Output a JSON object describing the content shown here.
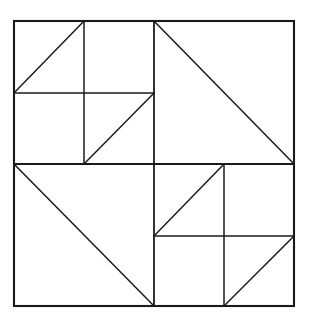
{
  "figure": {
    "background_color": "#ffffff",
    "line_color": "#1a1a1a",
    "canvas": {
      "width": 311,
      "height": 326
    },
    "bounds": {
      "left": 14,
      "top": 21,
      "right": 294,
      "bottom": 306
    },
    "center": {
      "x": 154,
      "y": 164
    }
  },
  "chart_data": {
    "type": "diagram",
    "xlim": [
      0,
      311
    ],
    "ylim": [
      0,
      326
    ],
    "grid": false,
    "legend": null,
    "shapes": [
      {
        "name": "outer-square",
        "kind": "rect",
        "x1": 14,
        "y1": 21,
        "x2": 294,
        "y2": 306,
        "class": "outer-edge"
      },
      {
        "name": "center-vertical-divider",
        "kind": "line",
        "x1": 154,
        "y1": 21,
        "x2": 154,
        "y2": 306,
        "class": "divider-edge"
      },
      {
        "name": "center-horizontal-divider",
        "kind": "line",
        "x1": 14,
        "y1": 164,
        "x2": 294,
        "y2": 164,
        "class": "divider-edge"
      },
      {
        "name": "topleft-inner-vertical",
        "kind": "line",
        "x1": 84,
        "y1": 21,
        "x2": 84,
        "y2": 164,
        "class": "inner-edge"
      },
      {
        "name": "topleft-inner-horizontal",
        "kind": "line",
        "x1": 14,
        "y1": 93,
        "x2": 154,
        "y2": 93,
        "class": "inner-edge"
      },
      {
        "name": "topleft-upper-diagonal",
        "kind": "line",
        "x1": 14,
        "y1": 93,
        "x2": 84,
        "y2": 21,
        "class": "diagonal-edge"
      },
      {
        "name": "topleft-lower-diagonal",
        "kind": "line",
        "x1": 84,
        "y1": 164,
        "x2": 154,
        "y2": 93,
        "class": "diagonal-edge"
      },
      {
        "name": "topright-diagonal",
        "kind": "line",
        "x1": 154,
        "y1": 21,
        "x2": 294,
        "y2": 164,
        "class": "diagonal-edge"
      },
      {
        "name": "bottomleft-diagonal",
        "kind": "line",
        "x1": 14,
        "y1": 164,
        "x2": 154,
        "y2": 306,
        "class": "diagonal-edge"
      },
      {
        "name": "bottomright-inner-vertical",
        "kind": "line",
        "x1": 224,
        "y1": 164,
        "x2": 224,
        "y2": 306,
        "class": "inner-edge"
      },
      {
        "name": "bottomright-inner-horizontal",
        "kind": "line",
        "x1": 154,
        "y1": 236,
        "x2": 294,
        "y2": 236,
        "class": "inner-edge"
      },
      {
        "name": "bottomright-upper-diagonal",
        "kind": "line",
        "x1": 154,
        "y1": 236,
        "x2": 224,
        "y2": 164,
        "class": "diagonal-edge"
      },
      {
        "name": "bottomright-lower-diagonal",
        "kind": "line",
        "x1": 224,
        "y1": 306,
        "x2": 294,
        "y2": 236,
        "class": "diagonal-edge"
      }
    ]
  }
}
